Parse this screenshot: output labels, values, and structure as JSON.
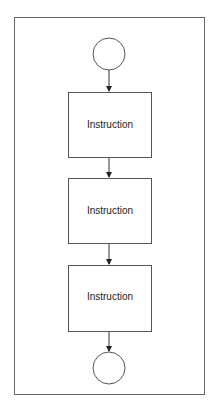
{
  "diagram": {
    "type": "flowchart",
    "frame": {
      "x": 14,
      "y": 17,
      "width": 191,
      "height": 378
    },
    "colors": {
      "stroke": "#555555",
      "text": "#222222",
      "background": "#ffffff"
    },
    "start": {
      "label": "",
      "cx": 109,
      "cy": 54,
      "r": 16
    },
    "steps": [
      {
        "label": "Instruction",
        "x": 68,
        "y": 92,
        "width": 83,
        "height": 65
      },
      {
        "label": "Instruction",
        "x": 68,
        "y": 178,
        "width": 83,
        "height": 65
      },
      {
        "label": "Instruction",
        "x": 68,
        "y": 265,
        "width": 83,
        "height": 66
      }
    ],
    "end": {
      "label": "",
      "cx": 109,
      "cy": 368,
      "r": 16
    }
  }
}
